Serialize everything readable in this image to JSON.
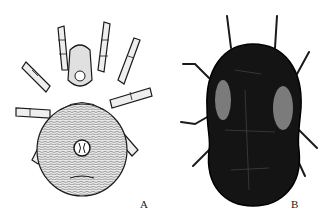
{
  "figure": {
    "panels": [
      {
        "id": "A",
        "label": "A",
        "subject": "mite-ventral-view"
      },
      {
        "id": "B",
        "label": "B",
        "subject": "mite-dorsal-view"
      }
    ],
    "colors": {
      "background": "#ffffff",
      "ink": "#1a1a1a",
      "body_fill_a": "#d9d9d9",
      "body_fill_b": "#141414"
    }
  }
}
